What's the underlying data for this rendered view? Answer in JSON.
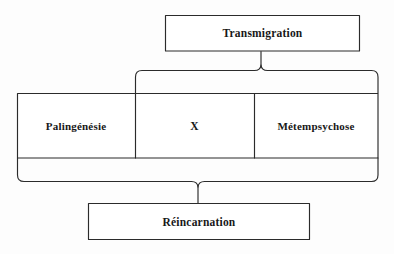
{
  "diagram": {
    "type": "bracket-grouping-diagram",
    "title_node": {
      "id": "transmigration",
      "label": "Transmigration"
    },
    "middle_row": {
      "cells": [
        {
          "id": "palingenesie",
          "label": "Palingénésie"
        },
        {
          "id": "x",
          "label": "X"
        },
        {
          "id": "metempsychose",
          "label": "Métempsychose"
        }
      ]
    },
    "bottom_node": {
      "id": "reincarnation",
      "label": "Réincarnation"
    },
    "braces": [
      {
        "id": "upper-brace",
        "direction": "up",
        "spans": [
          "x",
          "metempsychose"
        ],
        "points_to": "transmigration"
      },
      {
        "id": "lower-brace",
        "direction": "down",
        "spans": [
          "palingenesie",
          "x",
          "metempsychose"
        ],
        "points_to": "reincarnation"
      }
    ],
    "colors": {
      "background": "#fdfdfd",
      "stroke": "#2b2b2b",
      "text": "#181818"
    }
  }
}
